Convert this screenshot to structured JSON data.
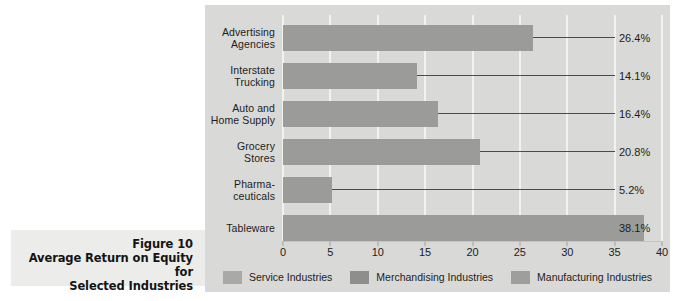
{
  "figure": {
    "caption_line1": "Figure 10",
    "caption_line2": "Average  Return on Equity for",
    "caption_line3": "Selected Industries"
  },
  "colors": {
    "panel_background": "#d9d9d7",
    "bar_fill": "#9b9b99",
    "gridline": "#f2f2f0",
    "leader_line": "#4b4b49",
    "caption_background": "#ececeb",
    "text": "#1d1d1b"
  },
  "chart_data": {
    "type": "bar",
    "orientation": "horizontal",
    "title": "Average Return on Equity for Selected Industries",
    "xlabel": "",
    "ylabel": "",
    "xlim": [
      0,
      40
    ],
    "xticks": [
      "0",
      "5",
      "10",
      "15",
      "20",
      "25",
      "30",
      "35",
      "40"
    ],
    "xtick_values": [
      0,
      5,
      10,
      15,
      20,
      25,
      30,
      35,
      40
    ],
    "grid": true,
    "grid_axis": "x",
    "legend_position": "bottom-center",
    "categories": [
      "Advertising Agencies",
      "Interstate Trucking",
      "Auto and Home Supply",
      "Grocery Stores",
      "Pharmaceuticals",
      "Tableware"
    ],
    "category_lines": [
      [
        "Advertising",
        "Agencies"
      ],
      [
        "Interstate",
        "Trucking"
      ],
      [
        "Auto and",
        "Home Supply"
      ],
      [
        "Grocery",
        "Stores"
      ],
      [
        "Pharma-",
        "ceuticals"
      ],
      [
        "Tableware"
      ]
    ],
    "values": [
      26.4,
      14.1,
      16.4,
      20.8,
      5.2,
      38.1
    ],
    "data_labels": [
      "26.4%",
      "14.1%",
      "16.4%",
      "20.8%",
      "5.2%",
      "38.1%"
    ],
    "legend": [
      {
        "label": "Service Industries",
        "color": "#a9a9a7"
      },
      {
        "label": "Merchandising Industries",
        "color": "#8e8e8c"
      },
      {
        "label": "Manufacturing Industries",
        "color": "#9e9e9c"
      }
    ]
  }
}
